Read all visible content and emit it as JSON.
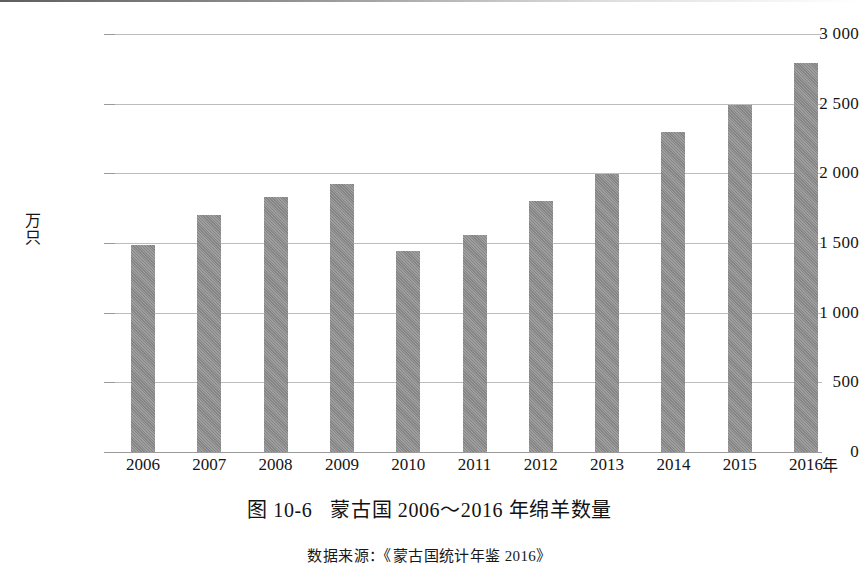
{
  "figure": {
    "caption_number": "图 10-6",
    "caption_title": "蒙古国 2006～2016 年绵羊数量",
    "source_note": "数据来源：《蒙古国统计年鉴 2016》",
    "bar_color": "#8c8c8c",
    "gridline_color": "#bcbcbc"
  },
  "chart_data": {
    "type": "bar",
    "title": "蒙古国 2006～2016 年绵羊数量",
    "subtitle": "图 10-6",
    "xlabel": "年",
    "ylabel": "万只",
    "categories": [
      "2006",
      "2007",
      "2008",
      "2009",
      "2010",
      "2011",
      "2012",
      "2013",
      "2014",
      "2015",
      "2016"
    ],
    "values": [
      1485,
      1700,
      1830,
      1925,
      1445,
      1555,
      1800,
      1995,
      2300,
      2490,
      2790
    ],
    "ylim": [
      0,
      3000
    ],
    "yticks": [
      0,
      500,
      1000,
      1500,
      2000,
      2500,
      3000
    ],
    "ytick_labels": [
      "0",
      "500",
      "1 000",
      "1 500",
      "2 000",
      "2 500",
      "3 000"
    ],
    "grid": true,
    "legend": "none",
    "annotations": [
      "数据来源：《蒙古国统计年鉴 2016》"
    ]
  }
}
